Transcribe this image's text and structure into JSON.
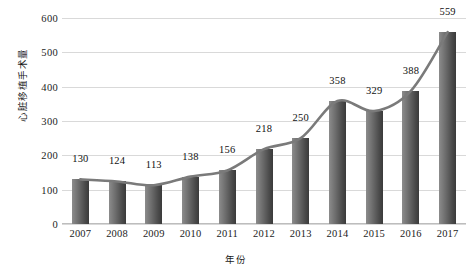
{
  "chart_data": {
    "type": "bar",
    "title": "",
    "subtitle": "",
    "xlabel": "年份",
    "ylabel": "心脏移植手术量",
    "categories": [
      "2007",
      "2008",
      "2009",
      "2010",
      "2011",
      "2012",
      "2013",
      "2014",
      "2015",
      "2016",
      "2017"
    ],
    "values": [
      130,
      124,
      113,
      138,
      156,
      218,
      250,
      358,
      329,
      388,
      559
    ],
    "data_labels": [
      "130",
      "124",
      "113",
      "138",
      "156",
      "218",
      "250",
      "358",
      "329",
      "388",
      "559"
    ],
    "ylim": [
      0,
      600
    ],
    "yticks": [
      0,
      100,
      200,
      300,
      400,
      500,
      600
    ],
    "ytick_labels": [
      "0",
      "100",
      "200",
      "300",
      "400",
      "500",
      "600"
    ],
    "grid": true,
    "legend": "none",
    "series": [
      {
        "name": "心脏移植手术量",
        "type": "bar",
        "values": [
          130,
          124,
          113,
          138,
          156,
          218,
          250,
          358,
          329,
          388,
          559
        ]
      },
      {
        "name": "趋势线",
        "type": "line-smooth",
        "values": [
          130,
          124,
          113,
          138,
          156,
          218,
          250,
          358,
          329,
          388,
          559
        ]
      }
    ],
    "colors": {
      "bar_light": "#8c8c8c",
      "bar_dark": "#3a3a3a",
      "trend_line": "#7a7a7a",
      "gridline": "#d9d9d9",
      "axis": "#bdbdbd",
      "text": "#1a1a1a",
      "background": "#ffffff"
    }
  }
}
